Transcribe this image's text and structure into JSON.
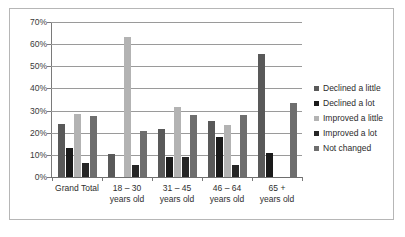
{
  "chart_data": {
    "type": "bar",
    "title": "",
    "subtitle": "",
    "xlabel": "",
    "ylabel": "",
    "ylim": [
      0,
      70
    ],
    "ytick_labels": [
      "70%",
      "60%",
      "50%",
      "40%",
      "30%",
      "20%",
      "10%",
      "0%"
    ],
    "ytick_values": [
      70,
      60,
      50,
      40,
      30,
      20,
      10,
      0
    ],
    "grid": true,
    "legend_position": "right",
    "categories": [
      "Grand Total",
      "18 – 30 years old",
      "31 – 45 years old",
      "46 – 64 years old",
      "65 + years old"
    ],
    "category_lines": [
      [
        "Grand Total",
        ""
      ],
      [
        "18 – 30",
        "years old"
      ],
      [
        "31 – 45",
        "years old"
      ],
      [
        "46 – 64",
        "years old"
      ],
      [
        "65 +",
        "years old"
      ]
    ],
    "series": [
      {
        "name": "Declined a little",
        "color": "#595959",
        "values": [
          24.0,
          10.5,
          21.8,
          25.1,
          55.6
        ]
      },
      {
        "name": "Declined a lot",
        "color": "#1a1a1a",
        "values": [
          13.1,
          0,
          9.1,
          18.0,
          11.0
        ]
      },
      {
        "name": "Improved a little",
        "color": "#b3b3b3",
        "values": [
          28.4,
          63.0,
          31.8,
          23.4,
          0
        ]
      },
      {
        "name": "Improved a lot",
        "color": "#262626",
        "values": [
          6.3,
          5.3,
          9.0,
          5.4,
          0
        ]
      },
      {
        "name": "Not changed",
        "color": "#6e6e6e",
        "values": [
          27.7,
          20.9,
          28.1,
          28.1,
          33.4
        ]
      }
    ]
  }
}
